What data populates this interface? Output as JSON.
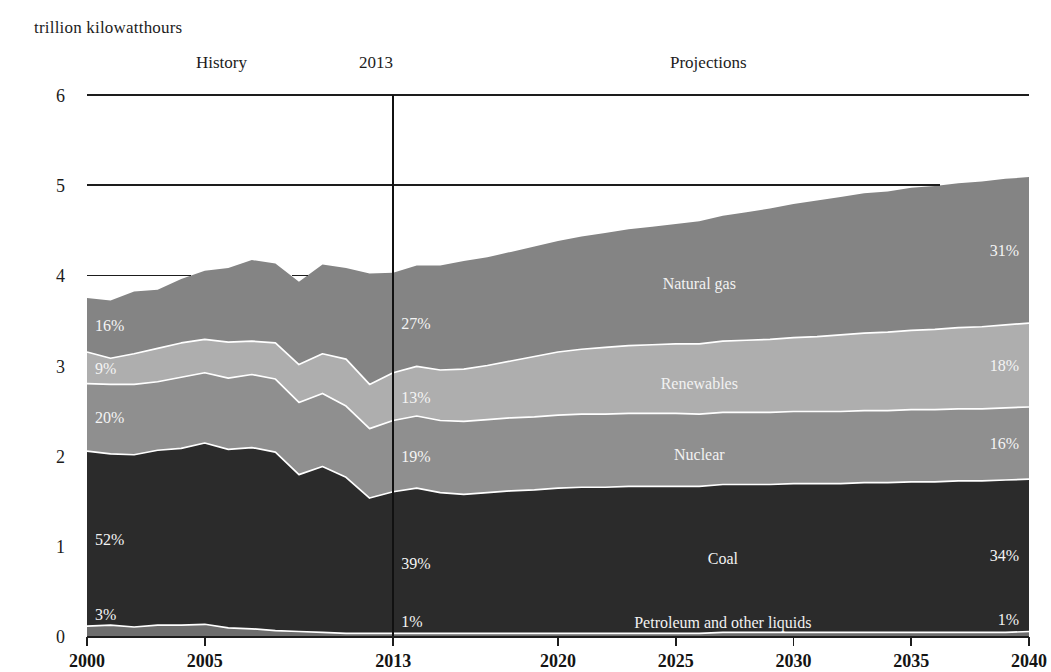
{
  "figure": {
    "unit_title": "trillion kilowatthours",
    "era_history": "History",
    "era_marker": "2013",
    "era_projections": "Projections"
  },
  "chart_data": {
    "type": "area",
    "stacked": true,
    "title": "trillion kilowatthours",
    "xlabel": "",
    "ylabel": "trillion kilowatthours",
    "xlim": [
      2000,
      2040
    ],
    "ylim": [
      0,
      6
    ],
    "yticks": [
      0,
      1,
      2,
      3,
      4,
      5,
      6
    ],
    "xticks": [
      2000,
      2005,
      2013,
      2020,
      2025,
      2030,
      2035,
      2040
    ],
    "grid": "horizontal gridlines at 4, 5, 6 drawn above fill",
    "legend": "inline labels inside bands",
    "annotations": {
      "history_label": "History",
      "projection_divider_year": 2013,
      "projections_label": "Projections"
    },
    "x": [
      2000,
      2001,
      2002,
      2003,
      2004,
      2005,
      2006,
      2007,
      2008,
      2009,
      2010,
      2011,
      2012,
      2013,
      2014,
      2015,
      2016,
      2017,
      2018,
      2019,
      2020,
      2021,
      2022,
      2023,
      2024,
      2025,
      2026,
      2027,
      2028,
      2029,
      2030,
      2031,
      2032,
      2033,
      2034,
      2035,
      2036,
      2037,
      2038,
      2039,
      2040
    ],
    "series": [
      {
        "name": "Petroleum and other liquids",
        "color": "#6d6d6d",
        "label_2000": "3%",
        "label_2013": "1%",
        "label_2040": "1%",
        "values": [
          0.11,
          0.12,
          0.1,
          0.12,
          0.12,
          0.13,
          0.09,
          0.08,
          0.06,
          0.05,
          0.04,
          0.03,
          0.03,
          0.03,
          0.03,
          0.03,
          0.03,
          0.03,
          0.03,
          0.03,
          0.03,
          0.03,
          0.03,
          0.03,
          0.03,
          0.03,
          0.03,
          0.04,
          0.04,
          0.04,
          0.04,
          0.04,
          0.04,
          0.04,
          0.04,
          0.04,
          0.04,
          0.04,
          0.04,
          0.04,
          0.05
        ]
      },
      {
        "name": "Coal",
        "color": "#2b2b2b",
        "label_2000": "52%",
        "label_2013": "39%",
        "label_2040": "34%",
        "values": [
          1.94,
          1.9,
          1.91,
          1.94,
          1.96,
          2.01,
          1.98,
          2.01,
          1.98,
          1.74,
          1.84,
          1.73,
          1.5,
          1.57,
          1.61,
          1.56,
          1.54,
          1.56,
          1.58,
          1.59,
          1.61,
          1.62,
          1.62,
          1.63,
          1.63,
          1.63,
          1.63,
          1.64,
          1.64,
          1.64,
          1.65,
          1.65,
          1.65,
          1.66,
          1.66,
          1.67,
          1.67,
          1.68,
          1.68,
          1.69,
          1.69
        ]
      },
      {
        "name": "Nuclear",
        "color": "#8f8f8f",
        "label_2000": "20%",
        "label_2013": "19%",
        "label_2040": "16%",
        "values": [
          0.75,
          0.77,
          0.78,
          0.76,
          0.79,
          0.78,
          0.79,
          0.81,
          0.81,
          0.8,
          0.81,
          0.79,
          0.77,
          0.79,
          0.8,
          0.8,
          0.81,
          0.81,
          0.81,
          0.81,
          0.81,
          0.81,
          0.81,
          0.81,
          0.81,
          0.81,
          0.8,
          0.8,
          0.8,
          0.8,
          0.8,
          0.8,
          0.8,
          0.8,
          0.8,
          0.8,
          0.8,
          0.8,
          0.8,
          0.8,
          0.8
        ]
      },
      {
        "name": "Renewables",
        "color": "#aeaeae",
        "label_2000": "9%",
        "label_2013": "13%",
        "label_2040": "18%",
        "values": [
          0.35,
          0.29,
          0.34,
          0.37,
          0.38,
          0.37,
          0.4,
          0.37,
          0.4,
          0.42,
          0.44,
          0.52,
          0.49,
          0.53,
          0.55,
          0.56,
          0.58,
          0.6,
          0.63,
          0.67,
          0.7,
          0.72,
          0.74,
          0.75,
          0.76,
          0.77,
          0.78,
          0.79,
          0.8,
          0.81,
          0.82,
          0.83,
          0.85,
          0.86,
          0.87,
          0.88,
          0.89,
          0.9,
          0.91,
          0.92,
          0.93
        ]
      },
      {
        "name": "Natural gas",
        "color": "#848484",
        "label_2000": "16%",
        "label_2013": "27%",
        "label_2040": "31%",
        "values": [
          0.6,
          0.64,
          0.69,
          0.65,
          0.71,
          0.76,
          0.82,
          0.9,
          0.88,
          0.92,
          0.99,
          1.01,
          1.23,
          1.11,
          1.12,
          1.16,
          1.2,
          1.2,
          1.21,
          1.22,
          1.23,
          1.25,
          1.27,
          1.29,
          1.31,
          1.33,
          1.36,
          1.39,
          1.42,
          1.45,
          1.48,
          1.51,
          1.53,
          1.55,
          1.56,
          1.58,
          1.59,
          1.6,
          1.61,
          1.62,
          1.62
        ]
      }
    ]
  }
}
